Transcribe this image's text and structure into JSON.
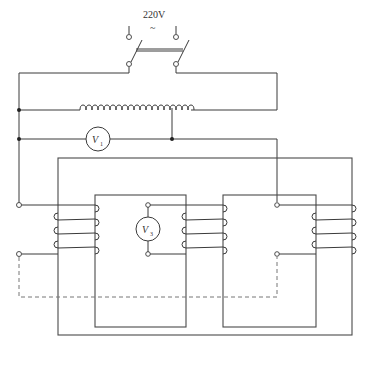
{
  "diagram": {
    "type": "transformer-experiment-circuit",
    "supply": {
      "voltage_label": "220V",
      "ac_symbol": "~"
    },
    "meters": [
      {
        "id": "V1",
        "symbol": "V",
        "subscript": "1",
        "role": "voltmeter across autotransformer output"
      },
      {
        "id": "V3",
        "symbol": "V",
        "subscript": "3",
        "role": "voltmeter across middle-limb coil"
      }
    ],
    "components": [
      "double-pole switch",
      "autotransformer (variac) with sliding tap",
      "outer iron core frame with two windows",
      "left primary coil (4 turns)",
      "middle limb coil (4 turns) with terminals",
      "right secondary coil (4 turns)",
      "dashed connection line"
    ]
  }
}
